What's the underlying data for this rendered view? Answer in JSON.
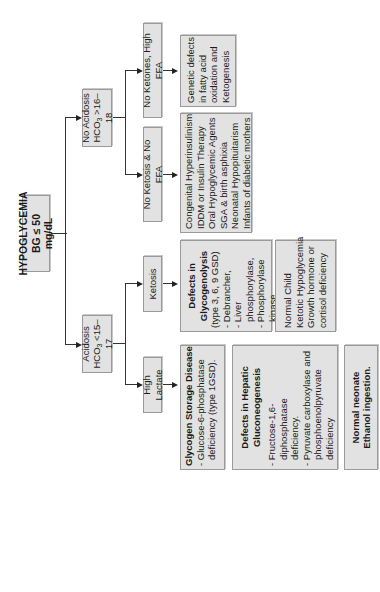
{
  "root": {
    "line1": "HYPOGLYCEMIA",
    "line2": "BG ≤ 50 mg/dL"
  },
  "branches": {
    "acidosis": {
      "line1": "Acidosis",
      "hco3_prefix": "HCO",
      "hco3_sub": "3",
      "hco3_suffix": " <15–17"
    },
    "no_acidosis": {
      "line1": "No Acidosis",
      "hco3_prefix": "HCO",
      "hco3_sub": "3",
      "hco3_suffix": " >16–18"
    }
  },
  "subbranches": {
    "high_lactate": "High Lactate",
    "ketosis": "Ketosis",
    "no_ketosis_no_ffa": "No Ketosis & No FFA",
    "no_ketones_high_ffa": "No Ketones, High FFA"
  },
  "outcomes": {
    "gsd": {
      "title": "Glycogen Storage Disease",
      "items": [
        "- Glucose-6-phosphatase deficiency (type 1GSD)."
      ]
    },
    "hepatic": {
      "title_line1": "Defects in Hepatic",
      "title_line2": "Gluconeogenesis",
      "items": [
        "- Fructose-1,6-diphosphatase deficiency.",
        "- Pyruvate carboxylase and phosphoenolpyruvate deficiency"
      ]
    },
    "neonate": {
      "line1": "Normal neonate",
      "line2": "Ethanol ingestion."
    },
    "glycogenolysis": {
      "title_line1": "Defects in",
      "title_line2": "Glycogenolysis",
      "subtitle": "(type 3, 6, 9 GSD)",
      "items": [
        "- Debrancher,",
        "- Liver phosphorylase,",
        "- Phosphorylase kinase deficiencies"
      ]
    },
    "normal_child": {
      "lines": [
        "Normal Child",
        "Ketotic Hypoglycemia",
        "Growth hormone or",
        "cortisol deficiency"
      ]
    },
    "congenital": {
      "lines": [
        "Congenital Hyperinsulinism",
        "IDDM or Insulin Therapy",
        "Oral Hypoglycemic Agents",
        "SGA & birth asphixia",
        "Neonatal Hypopituitarism",
        "Infants of diabetic mothers"
      ]
    },
    "genetic": {
      "lines": [
        "Genetic defects",
        "in fatty acid",
        "oxidation and",
        "Ketogenesis"
      ]
    }
  },
  "colors": {
    "box_fill": "#e2e2e2",
    "box_border": "#9a9a9a",
    "line": "#333333"
  }
}
